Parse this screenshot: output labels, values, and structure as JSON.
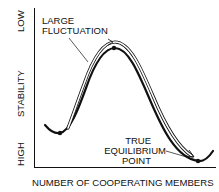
{
  "diagram": {
    "y_axis": {
      "label": "STABILITY",
      "top_label": "LOW",
      "bottom_label": "HIGH"
    },
    "x_axis": {
      "label": "NUMBER OF COOPERATING MEMBERS"
    },
    "annotations": {
      "large_fluctuation": [
        "LARGE",
        "FLUCTUATION"
      ],
      "true_equilibrium": [
        "TRUE",
        "EQUILIBRIUM",
        "POINT"
      ]
    },
    "curve": {
      "description": "Energy-landscape style curve: local minimum at left, high peak in middle (unstable), global minimum at right (true equilibrium)",
      "points": [
        {
          "name": "local-minimum",
          "x": 60,
          "y": 133
        },
        {
          "name": "peak",
          "x": 115,
          "y": 48
        },
        {
          "name": "true-equilibrium",
          "x": 198,
          "y": 161
        }
      ]
    },
    "colors": {
      "line": "#111111",
      "background": "#ffffff"
    }
  }
}
